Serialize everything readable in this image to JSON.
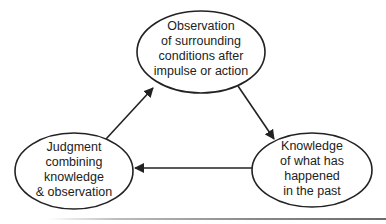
{
  "diagram": {
    "type": "cycle",
    "nodes": [
      {
        "id": "observation",
        "lines": [
          "Observation",
          "of surrounding",
          "conditions after",
          "impulse or action"
        ]
      },
      {
        "id": "knowledge",
        "lines": [
          "Knowledge",
          "of what has",
          "happened",
          "in the past"
        ]
      },
      {
        "id": "judgment",
        "lines": [
          "Judgment",
          "combining",
          "knowledge",
          "& observation"
        ]
      }
    ],
    "edges": [
      {
        "from": "observation",
        "to": "knowledge"
      },
      {
        "from": "knowledge",
        "to": "judgment"
      },
      {
        "from": "judgment",
        "to": "observation"
      }
    ],
    "colors": {
      "stroke": "#222222",
      "text": "#222222",
      "background": "#ffffff"
    }
  }
}
